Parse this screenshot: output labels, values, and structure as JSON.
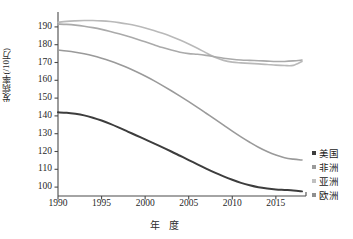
{
  "chart_data": {
    "type": "line",
    "title": "",
    "xlabel": "年  度",
    "ylabel": "发病率(/10万)",
    "xlim": [
      1990,
      2018
    ],
    "ylim": [
      95,
      195
    ],
    "xticks": [
      "1990",
      "1995",
      "2000",
      "2005",
      "2010",
      "2015"
    ],
    "xtick_values": [
      1990,
      1995,
      2000,
      2005,
      2010,
      2015
    ],
    "yticks": [
      "100",
      "110",
      "120",
      "130",
      "140",
      "150",
      "160",
      "170",
      "180",
      "190"
    ],
    "ytick_values": [
      100,
      110,
      120,
      130,
      140,
      150,
      160,
      170,
      180,
      190
    ],
    "grid": false,
    "legend_position": "right",
    "x": [
      1990,
      1991,
      1992,
      1993,
      1994,
      1995,
      1996,
      1997,
      1998,
      1999,
      2000,
      2001,
      2002,
      2003,
      2004,
      2005,
      2006,
      2007,
      2008,
      2009,
      2010,
      2011,
      2012,
      2013,
      2014,
      2015,
      2016,
      2017,
      2018
    ],
    "series": [
      {
        "name": "美国",
        "color": "#3d3d3d",
        "width": 2.0,
        "values": [
          142.0,
          141.8,
          141.2,
          140.3,
          139.0,
          137.4,
          135.5,
          133.4,
          131.2,
          129.0,
          126.8,
          124.6,
          122.3,
          120.0,
          117.6,
          115.2,
          112.8,
          110.4,
          108.1,
          106.0,
          104.1,
          102.4,
          101.0,
          99.9,
          99.2,
          98.7,
          98.4,
          98.1,
          97.6
        ]
      },
      {
        "name": "非洲",
        "color": "#9a9a9a",
        "width": 1.6,
        "values": [
          177.0,
          176.5,
          175.8,
          174.9,
          173.8,
          172.4,
          170.8,
          169.0,
          167.0,
          164.8,
          162.4,
          159.8,
          157.0,
          154.1,
          151.1,
          148.0,
          144.8,
          141.5,
          138.2,
          134.8,
          131.4,
          128.2,
          125.2,
          122.4,
          120.0,
          118.0,
          116.5,
          115.7,
          115.2
        ]
      },
      {
        "name": "亚洲",
        "color": "#b9b9b9",
        "width": 1.6,
        "values": [
          192.6,
          193.1,
          193.4,
          193.6,
          193.6,
          193.4,
          193.0,
          192.4,
          191.6,
          190.6,
          189.4,
          188.0,
          186.4,
          184.6,
          182.6,
          180.4,
          178.0,
          175.4,
          173.0,
          171.2,
          170.2,
          169.8,
          169.5,
          169.2,
          168.9,
          168.5,
          168.3,
          168.4,
          170.6
        ]
      },
      {
        "name": "欧洲",
        "color": "#aaaaaa",
        "width": 1.6,
        "values": [
          191.6,
          191.4,
          191.0,
          190.4,
          189.6,
          188.6,
          187.4,
          186.1,
          184.7,
          183.2,
          181.6,
          180.0,
          178.4,
          177.0,
          175.8,
          175.0,
          174.6,
          174.0,
          173.2,
          172.4,
          171.8,
          171.4,
          171.2,
          171.0,
          170.8,
          170.6,
          170.6,
          170.9,
          171.4
        ]
      }
    ]
  },
  "legend": {
    "items": [
      {
        "label": "美国",
        "color": "#3d3d3d"
      },
      {
        "label": "非洲",
        "color": "#9a9a9a"
      },
      {
        "label": "亚洲",
        "color": "#c0c0c0"
      },
      {
        "label": "欧洲",
        "color": "#8f8f8f"
      }
    ]
  },
  "axes": {
    "line_color": "#4a4a4a"
  }
}
